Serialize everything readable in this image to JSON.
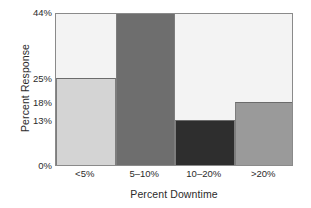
{
  "chart_data": {
    "type": "bar",
    "title": "",
    "xlabel": "Percent Downtime",
    "ylabel": "Percent Response",
    "categories": [
      "<5%",
      "5–10%",
      "10–20%",
      ">20%"
    ],
    "values": [
      25,
      44,
      13,
      18
    ],
    "value_labels": [
      "25%",
      "44%",
      "13%",
      "18%"
    ],
    "ytick_values": [
      0,
      13,
      18,
      25,
      44
    ],
    "ytick_labels": [
      "0%",
      "13%",
      "18%",
      "25%",
      "44%"
    ],
    "ylim": [
      0,
      44
    ],
    "grid": false,
    "legend": "none",
    "bar_colors": [
      "#d4d4d4",
      "#6e6e6e",
      "#2e2e2e",
      "#9a9a9a"
    ],
    "plot_background": "#f3f3f3",
    "frame_color": "#8a8a8a",
    "figure_background": "#ffffff",
    "text_color": "#2b2b2b"
  }
}
